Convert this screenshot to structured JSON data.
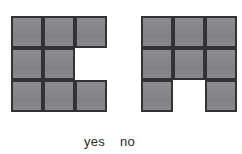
{
  "canvas": {
    "width": 242,
    "height": 154,
    "background_color": "#ffffff"
  },
  "style": {
    "cell_fill_color": "#87878a",
    "cell_border_color": "#333336",
    "label_text_color": "#2b2b2b",
    "cell_size_px": 32
  },
  "figures": [
    {
      "id": "figure-left",
      "name": "left-polyomino",
      "answer_label": "yes",
      "grid_rows": 3,
      "grid_cols": 3,
      "description": "3 by 3 square grid with the middle-right cell removed, forming a C shape",
      "filled_count": 8,
      "cells": [
        [
          1,
          1,
          1
        ],
        [
          1,
          1,
          0
        ],
        [
          1,
          1,
          1
        ]
      ]
    },
    {
      "id": "figure-right",
      "name": "right-polyomino",
      "answer_label": "no",
      "grid_rows": 3,
      "grid_cols": 3,
      "description": "3 by 3 square grid with the bottom-middle cell removed, forming an arch shape",
      "filled_count": 8,
      "cells": [
        [
          1,
          1,
          1
        ],
        [
          1,
          1,
          1
        ],
        [
          1,
          0,
          1
        ]
      ]
    }
  ],
  "labels": {
    "yes": "yes",
    "no": "no"
  }
}
